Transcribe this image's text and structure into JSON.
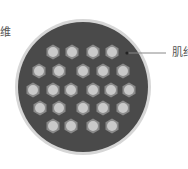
{
  "diagram": {
    "labels": {
      "left": "维",
      "right": "肌纤"
    },
    "colors": {
      "outer_ring": "#d6d6d6",
      "interior": "#4a4a4a",
      "fiber_hex": "#8a8a8a",
      "fiber_core": "#c9c9c9",
      "pointer": "#222222",
      "leader_line": "#888888"
    },
    "circle": {
      "cx": 83,
      "cy": 87,
      "r": 68
    },
    "fibers": [
      {
        "x": 53,
        "y": 52
      },
      {
        "x": 72,
        "y": 52
      },
      {
        "x": 93,
        "y": 52
      },
      {
        "x": 112,
        "y": 52
      },
      {
        "x": 39,
        "y": 71
      },
      {
        "x": 59,
        "y": 71
      },
      {
        "x": 83,
        "y": 71
      },
      {
        "x": 103,
        "y": 71
      },
      {
        "x": 123,
        "y": 71
      },
      {
        "x": 33,
        "y": 90
      },
      {
        "x": 53,
        "y": 90
      },
      {
        "x": 71,
        "y": 90
      },
      {
        "x": 93,
        "y": 90
      },
      {
        "x": 111,
        "y": 90
      },
      {
        "x": 129,
        "y": 90
      },
      {
        "x": 40,
        "y": 108
      },
      {
        "x": 59,
        "y": 108
      },
      {
        "x": 83,
        "y": 108
      },
      {
        "x": 103,
        "y": 108
      },
      {
        "x": 123,
        "y": 108
      },
      {
        "x": 53,
        "y": 126
      },
      {
        "x": 71,
        "y": 126
      },
      {
        "x": 93,
        "y": 126
      },
      {
        "x": 112,
        "y": 126
      }
    ]
  }
}
